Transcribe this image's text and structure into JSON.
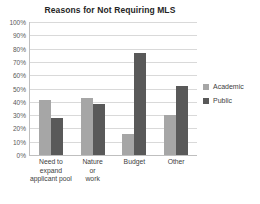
{
  "chart_data": {
    "type": "bar",
    "title": "Reasons for Not Requiring MLS",
    "xlabel": "",
    "ylabel": "",
    "ylim": [
      0,
      100
    ],
    "ytick_labels": [
      "100%",
      "90%",
      "80%",
      "70%",
      "60%",
      "50%",
      "40%",
      "30%",
      "20%",
      "10%",
      "0%"
    ],
    "ytick_values": [
      100,
      90,
      80,
      70,
      60,
      50,
      40,
      30,
      20,
      10,
      0
    ],
    "grid": true,
    "legend_position": "right",
    "categories": [
      "Need to expand applicant pool",
      "Nature or work",
      "Budget",
      "Other"
    ],
    "category_lines": [
      [
        "Need to",
        "expand",
        "applicant pool"
      ],
      [
        "Nature",
        "or",
        "work"
      ],
      [
        "Budget"
      ],
      [
        "Other"
      ]
    ],
    "series": [
      {
        "name": "Academic",
        "color": "#a6a6a6",
        "values": [
          41,
          43,
          16,
          30
        ]
      },
      {
        "name": "Public",
        "color": "#595959",
        "values": [
          28,
          38,
          77,
          52
        ]
      }
    ]
  },
  "colors": {
    "academic": "#a6a6a6",
    "public": "#595959",
    "gridline": "#d9d9d9",
    "axis": "#bfbfbf",
    "title_text": "#262626",
    "label_text": "#404040"
  }
}
